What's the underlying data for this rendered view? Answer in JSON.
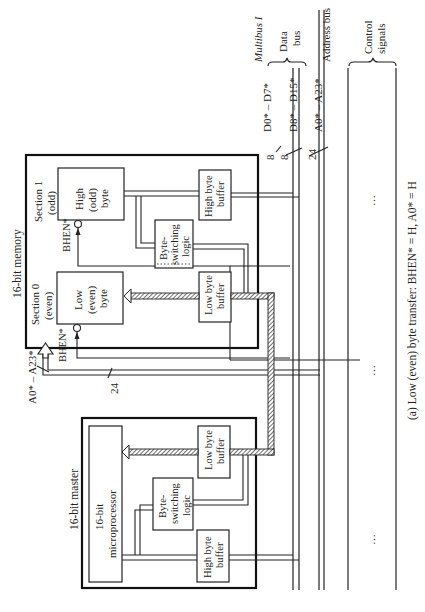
{
  "memory": {
    "title": "16-bit memory",
    "section1": {
      "label_line1": "Section 1",
      "label_line2": "(odd)"
    },
    "section0": {
      "label_line1": "Section 0",
      "label_line2": "(even)"
    },
    "high_byte": {
      "line1": "High",
      "line2": "(odd)",
      "line3": "byte"
    },
    "low_byte": {
      "line1": "Low",
      "line2": "(even)",
      "line3": "byte"
    },
    "bhen_label": "BHEN*",
    "byte_switching": {
      "line1": "Byte-",
      "line2": "switching",
      "line3": "logic"
    },
    "high_buffer": {
      "line1": "High  byte",
      "line2": "buffer"
    },
    "low_buffer": {
      "line1": "Low byte",
      "line2": "buffer"
    },
    "address_label": "A0* – A23*",
    "address_width": "24"
  },
  "master": {
    "title": "16-bit master",
    "cpu": {
      "line1": "16-bit",
      "line2": "microprocessor"
    },
    "byte_switching": {
      "line1": "Byte-",
      "line2": "switching",
      "line3": "logic"
    },
    "low_buffer": {
      "line1": "Low byte",
      "line2": "buffer"
    },
    "high_buffer": {
      "line1": "High byte",
      "line2": "buffer"
    }
  },
  "bus": {
    "name": "Multibus I",
    "data_bus": {
      "line1": "Data",
      "line2": "bus"
    },
    "address_bus": "Address bus",
    "control": {
      "line1": "Control",
      "line2": "signals"
    },
    "lines": [
      {
        "label": "D0* – D7*",
        "width": "8"
      },
      {
        "label": "D8* – D15*",
        "width": "8"
      },
      {
        "label": "A0* – A23*",
        "width": "24"
      }
    ],
    "ellipsis": "⋮"
  },
  "caption": "(a) Low (even) byte transfer: BHEN* = H, A0* = H"
}
